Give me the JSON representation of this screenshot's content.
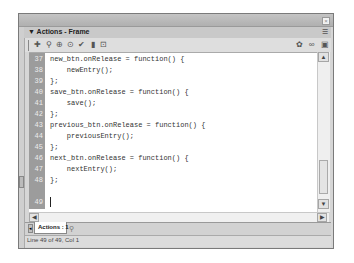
{
  "window": {
    "close_glyph": "×"
  },
  "panel": {
    "title": "▼ Actions - Frame",
    "menu_glyph": "☰"
  },
  "toolbar": {
    "left_icons": [
      {
        "name": "add-script-item-icon",
        "glyph": "✚"
      },
      {
        "name": "find-icon",
        "glyph": "⚲"
      },
      {
        "name": "insert-target-path-icon",
        "glyph": "⊕"
      },
      {
        "name": "check-syntax-icon",
        "glyph": "⊙"
      },
      {
        "name": "check-mark-icon",
        "glyph": "✔"
      },
      {
        "name": "auto-format-icon",
        "glyph": "▮"
      },
      {
        "name": "show-code-hint-icon",
        "glyph": "⊡"
      }
    ],
    "right_icons": [
      {
        "name": "debug-options-icon",
        "glyph": "✿"
      },
      {
        "name": "reference-icon",
        "glyph": "∞"
      },
      {
        "name": "view-options-icon",
        "glyph": "▣"
      }
    ]
  },
  "editor": {
    "lines": [
      {
        "num": "37",
        "text": "new_btn.onRelease = function() {"
      },
      {
        "num": "38",
        "text": "    newEntry();"
      },
      {
        "num": "39",
        "text": "};"
      },
      {
        "num": "40",
        "text": "save_btn.onRelease = function() {"
      },
      {
        "num": "41",
        "text": "    save();"
      },
      {
        "num": "42",
        "text": "};"
      },
      {
        "num": "43",
        "text": "previous_btn.onRelease = function() {"
      },
      {
        "num": "44",
        "text": "    previousEntry();"
      },
      {
        "num": "45",
        "text": "};"
      },
      {
        "num": "46",
        "text": "next_btn.onRelease = function() {"
      },
      {
        "num": "47",
        "text": "    nextEntry();"
      },
      {
        "num": "48",
        "text": "};"
      },
      {
        "num": "49",
        "text": ""
      }
    ]
  },
  "scrollbars": {
    "up_glyph": "▲",
    "down_glyph": "▼",
    "left_glyph": "◀",
    "right_glyph": "▶"
  },
  "tabs": {
    "arrow_glyph": "◂",
    "active_tab": "Actions : 1",
    "pin_glyph": "⚲"
  },
  "status": {
    "text": "Line 49 of 49, Col 1"
  }
}
